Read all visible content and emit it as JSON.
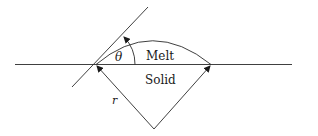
{
  "diagram": {
    "type": "contact-angle-schematic",
    "labels": {
      "angle": "θ",
      "upper_region": "Melt",
      "lower_region": "Solid",
      "radius": "r"
    },
    "colors": {
      "line": "#2a2a2a",
      "background": "#ffffff"
    }
  }
}
